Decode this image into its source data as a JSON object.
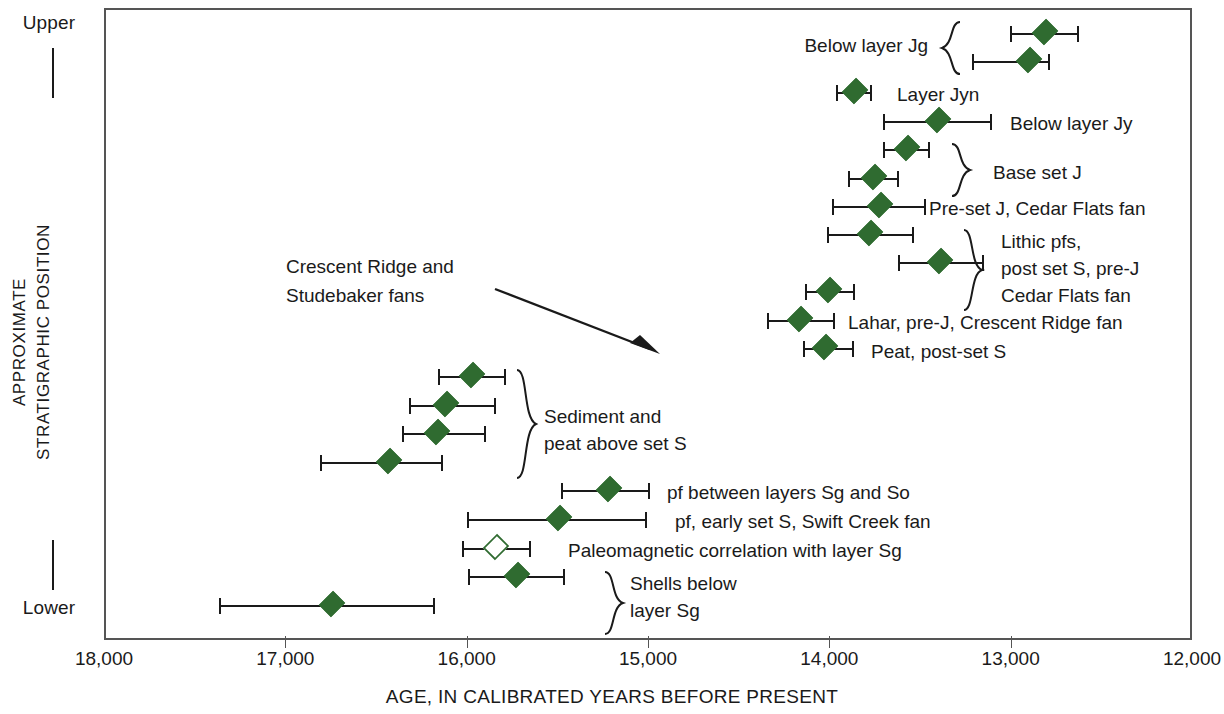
{
  "axis": {
    "y_upper_label": "Upper",
    "y_lower_label": "Lower",
    "y_title": "APPROXIMATE\nSTRATIGRAPHIC POSITION",
    "x_label": "AGE, IN CALIBRATED YEARS BEFORE PRESENT",
    "x_ticks": [
      "18,000",
      "17,000",
      "16,000",
      "15,000",
      "14,000",
      "13,000",
      "12,000"
    ]
  },
  "annotation": {
    "text": "Crescent Ridge and\nStudebaker fans"
  },
  "labels": {
    "below_layer_jg": "Below layer Jg",
    "layer_jyn": "Layer Jyn",
    "below_layer_jy": "Below layer Jy",
    "base_set_j": "Base set J",
    "pre_set_j": "Pre-set J, Cedar Flats fan",
    "lithic_pfs": "Lithic pfs,\npost set S, pre-J\nCedar Flats fan",
    "lahar": "Lahar, pre-J, Crescent Ridge fan",
    "peat": "Peat, post-set S",
    "sediment_peat": "Sediment and\npeat above set S",
    "pf_between": "pf between layers Sg and So",
    "pf_early": "pf, early set S, Swift Creek fan",
    "paleomag": "Paleomagnetic correlation with layer Sg",
    "shells_below": "Shells below\nlayer Sg"
  },
  "colors": {
    "marker_fill": "#2f6b30",
    "marker_open_fill": "#ffffff",
    "line": "#1a1a1a",
    "frame": "#555555"
  },
  "chart_data": {
    "type": "scatter",
    "title": "",
    "xlabel": "AGE, IN CALIBRATED YEARS BEFORE PRESENT",
    "ylabel": "APPROXIMATE STRATIGRAPHIC POSITION",
    "xlim": [
      18000,
      12000
    ],
    "x_reversed": true,
    "x_ticks": [
      18000,
      17000,
      16000,
      15000,
      14000,
      13000,
      12000
    ],
    "ylim_labels": [
      "Lower",
      "Upper"
    ],
    "grid": false,
    "legend": null,
    "units": "calibrated years before present",
    "points": [
      {
        "id": "jg-1",
        "label": "Below layer Jg",
        "age": 12810,
        "low": 13000,
        "high": 12630,
        "marker": "filled-diamond",
        "y": 34
      },
      {
        "id": "jg-2",
        "label": "Below layer Jg",
        "age": 12900,
        "low": 13210,
        "high": 12790,
        "marker": "filled-diamond",
        "y": 62
      },
      {
        "id": "jyn",
        "label": "Layer Jyn",
        "age": 13860,
        "low": 13955,
        "high": 13770,
        "marker": "filled-diamond",
        "y": 93
      },
      {
        "id": "jy",
        "label": "Below layer Jy",
        "age": 13400,
        "low": 13700,
        "high": 13110,
        "marker": "filled-diamond",
        "y": 122
      },
      {
        "id": "basej-1",
        "label": "Base set J",
        "age": 13570,
        "low": 13700,
        "high": 13450,
        "marker": "filled-diamond",
        "y": 150
      },
      {
        "id": "basej-2",
        "label": "Base set J",
        "age": 13755,
        "low": 13890,
        "high": 13620,
        "marker": "filled-diamond",
        "y": 179
      },
      {
        "id": "presetj",
        "label": "Pre-set J, Cedar Flats fan",
        "age": 13720,
        "low": 13980,
        "high": 13470,
        "marker": "filled-diamond",
        "y": 207
      },
      {
        "id": "lithic-1",
        "label": "Lithic pfs, post set J",
        "age": 13775,
        "low": 14010,
        "high": 13540,
        "marker": "filled-diamond",
        "y": 235
      },
      {
        "id": "lithic-2",
        "label": "Lithic pfs, post set S, pre-J",
        "age": 13390,
        "low": 13615,
        "high": 13155,
        "marker": "filled-diamond",
        "y": 263
      },
      {
        "id": "cedarflats",
        "label": "Cedar Flats fan",
        "age": 14000,
        "low": 14130,
        "high": 13865,
        "marker": "filled-diamond",
        "y": 292
      },
      {
        "id": "lahar",
        "label": "Lahar, pre-J, Crescent Ridge fan",
        "age": 14160,
        "low": 14340,
        "high": 13975,
        "marker": "filled-diamond",
        "y": 321
      },
      {
        "id": "peat",
        "label": "Peat, post-set S",
        "age": 14025,
        "low": 14140,
        "high": 13870,
        "marker": "filled-diamond",
        "y": 349
      },
      {
        "id": "sed-1",
        "label": "Sediment and peat above set S",
        "age": 15970,
        "low": 16150,
        "high": 15790,
        "marker": "filled-diamond",
        "y": 377
      },
      {
        "id": "sed-2",
        "label": "Sediment and peat above set S",
        "age": 16115,
        "low": 16315,
        "high": 15845,
        "marker": "filled-diamond",
        "y": 406
      },
      {
        "id": "sed-3",
        "label": "Sediment and peat above set S",
        "age": 16165,
        "low": 16350,
        "high": 15900,
        "marker": "filled-diamond",
        "y": 434
      },
      {
        "id": "sed-4",
        "label": "Sediment and peat above set S",
        "age": 16430,
        "low": 16805,
        "high": 16135,
        "marker": "filled-diamond",
        "y": 463
      },
      {
        "id": "pf-between",
        "label": "pf between layers Sg and So",
        "age": 15215,
        "low": 15475,
        "high": 14995,
        "marker": "filled-diamond",
        "y": 491
      },
      {
        "id": "pf-early",
        "label": "pf, early set S, Swift Creek fan",
        "age": 15490,
        "low": 15990,
        "high": 15010,
        "marker": "filled-diamond",
        "y": 520
      },
      {
        "id": "paleomag",
        "label": "Paleomagnetic correlation with layer Sg",
        "age": 15840,
        "low": 16020,
        "high": 15650,
        "marker": "open-diamond",
        "y": 549
      },
      {
        "id": "shells-1",
        "label": "Shells below layer Sg",
        "age": 15725,
        "low": 15985,
        "high": 15465,
        "marker": "filled-diamond",
        "y": 577
      },
      {
        "id": "shells-2",
        "label": "Shells below layer Sg",
        "age": 16745,
        "low": 17360,
        "high": 16180,
        "marker": "filled-diamond",
        "y": 606
      }
    ]
  }
}
